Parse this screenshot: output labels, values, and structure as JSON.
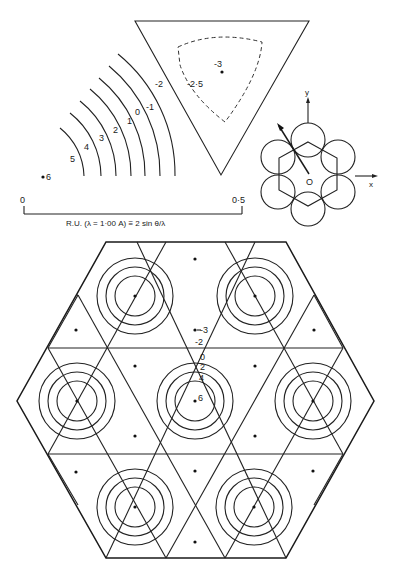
{
  "header": {
    "running_title": ""
  },
  "upper_left": {
    "arc_labels": [
      "5",
      "4",
      "3",
      "2",
      "1",
      "0",
      "-1"
    ],
    "point_label": "6",
    "axis": {
      "tick_start": "0",
      "tick_end": "0·5",
      "caption": "R.U. (λ = 1·00 A) ≡ 2 sin θ/λ"
    }
  },
  "triangle": {
    "edge_label": "-2",
    "dashed_label": "-2·5",
    "center_label": "-3"
  },
  "lattice_inset": {
    "axis_x": "x",
    "axis_y": "y",
    "origin": "O"
  },
  "hexagon_map": {
    "labels": {
      "minus3": "-3",
      "minus2": "-2",
      "zero": "0",
      "two": "2",
      "four": "4",
      "six": "6"
    }
  },
  "colors": {
    "ink": "#1a1a1a",
    "paper": "#ffffff"
  }
}
